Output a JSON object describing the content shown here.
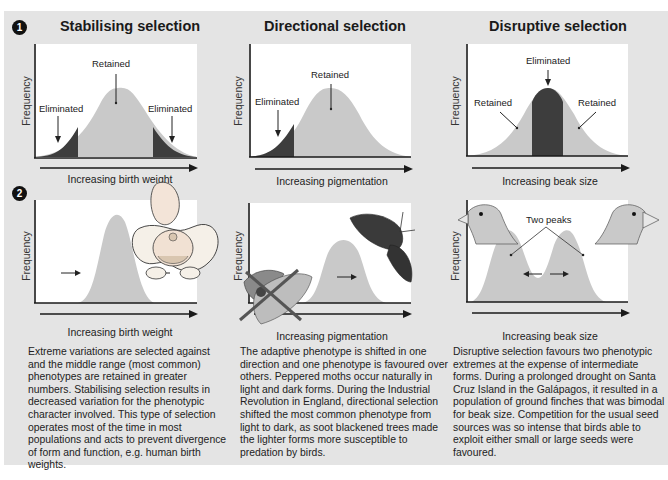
{
  "panels": [
    {
      "id": "stabilising",
      "number": "1",
      "title": "Stabilising selection",
      "top_chart": {
        "ylabel": "Frequency",
        "xlabel": "Increasing birth weight",
        "labels": {
          "left": "Eliminated",
          "center": "Retained",
          "right": "Eliminated"
        }
      },
      "bottom_chart": {
        "ylabel": "Frequency",
        "xlabel": "Increasing birth weight",
        "illustration": "baby-in-pelvis"
      },
      "description": "Extreme variations are selected against and the middle range (most common) phenotypes are retained in greater numbers. Stabilising selection results in decreased variation for the phenotypic character involved. This type of selection operates most of the time in most populations and acts to prevent divergence of form and function, e.g. human birth weights."
    },
    {
      "id": "directional",
      "number": "2",
      "title": "Directional selection",
      "top_chart": {
        "ylabel": "Frequency",
        "xlabel": "Increasing pigmentation",
        "labels": {
          "left": "Eliminated",
          "center": "Retained"
        }
      },
      "bottom_chart": {
        "ylabel": "Frequency",
        "xlabel": "Increasing pigmentation",
        "illustration": "peppered-moths"
      },
      "description": "The adaptive phenotype is shifted in one direction and one phenotype is favoured over others. Peppered moths occur naturally in light and dark forms. During the Industrial Revolution in England, directional selection shifted the most common phenotype from light to dark, as soot blackened trees made the lighter forms more susceptible to predation by birds."
    },
    {
      "id": "disruptive",
      "title": "Disruptive selection",
      "top_chart": {
        "ylabel": "Frequency",
        "xlabel": "Increasing beak size",
        "labels": {
          "center": "Eliminated",
          "left": "Retained",
          "right": "Retained"
        }
      },
      "bottom_chart": {
        "ylabel": "Frequency",
        "xlabel": "Increasing beak size",
        "labels": {
          "peaks": "Two peaks"
        },
        "illustration": "finch-heads"
      },
      "description": "Disruptive selection favours two phenotypic extremes at the expense of intermediate forms. During a prolonged drought on Santa Cruz Island in the Galápagos, it resulted in a population of ground finches that was bimodal for beak size. Competition for the usual seed sources was so intense that birds able to exploit either small or large seeds were favoured."
    }
  ],
  "colors": {
    "background": "#e4e4e4",
    "chart_bg": "#ffffff",
    "retained": "#c9c9c9",
    "eliminated": "#3d3d3d",
    "axis": "#1a1a1a"
  }
}
